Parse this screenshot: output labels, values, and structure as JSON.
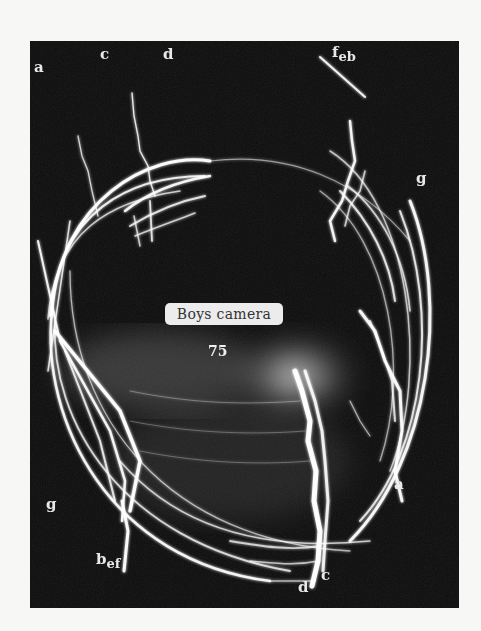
{
  "figure": {
    "caption_label": "Boys camera",
    "plate_number": "75",
    "background_color": "#0b0b0b",
    "page_color": "#f7f7f5",
    "stroke_color": "#ffffff"
  },
  "labels": {
    "top": [
      {
        "id": "a",
        "text": "a"
      },
      {
        "id": "c",
        "text": "c"
      },
      {
        "id": "d",
        "text": "d"
      },
      {
        "id": "feb",
        "text": "f",
        "sub1": "e",
        "sub2": "b"
      }
    ],
    "right": [
      {
        "id": "g-right",
        "text": "g"
      },
      {
        "id": "a-right",
        "text": "a"
      }
    ],
    "left": [
      {
        "id": "g-left",
        "text": "g"
      }
    ],
    "bottom": [
      {
        "id": "bef",
        "text": "b",
        "sub1": "e",
        "sub2": "f"
      },
      {
        "id": "d-bottom",
        "text": "d"
      },
      {
        "id": "c-bottom",
        "text": "c"
      }
    ]
  }
}
